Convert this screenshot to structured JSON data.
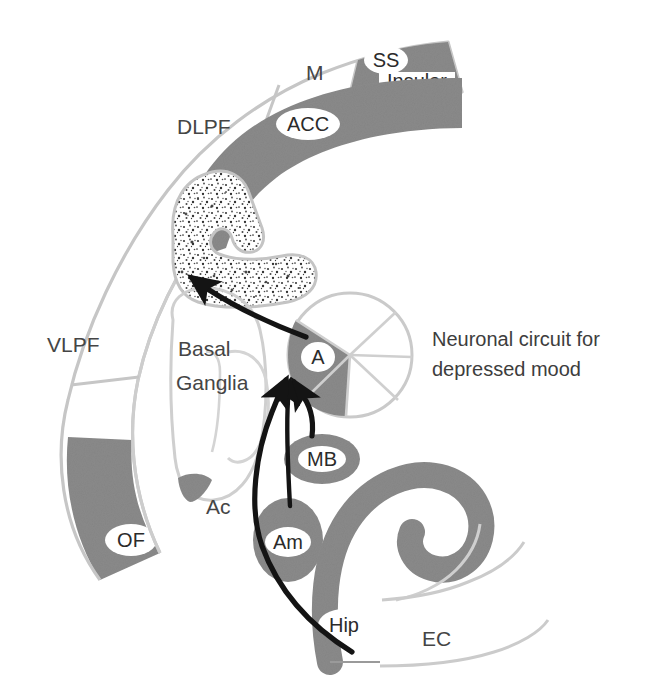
{
  "figure": {
    "title_caption": {
      "line1": "Neuronal circuit for",
      "line2": "depressed mood"
    },
    "colors": {
      "background": "#ffffff",
      "shaded_region": "#8a8a8a",
      "outline_light": "#c8c8c8",
      "outline_mid": "#b0b0b0",
      "arrow": "#141414",
      "text": "#3a3a3a",
      "badge_fill": "#ffffff",
      "stipple_dot": "#3c3c3c"
    },
    "cortical_arc": {
      "description": "outer cortical ribbon arc",
      "segments": [
        {
          "id": "vlpf",
          "label": "VLPF",
          "shaded": false
        },
        {
          "id": "dlpf",
          "label": "DLPF",
          "shaded": false
        },
        {
          "id": "m",
          "label": "M",
          "shaded": false
        },
        {
          "id": "ss",
          "label": "SS",
          "shaded": true,
          "badge": true
        },
        {
          "id": "insular",
          "label": "Insular",
          "shaded": true,
          "badge": true
        },
        {
          "id": "of",
          "label": "OF",
          "shaded": true,
          "badge": true
        }
      ]
    },
    "inner_structures": [
      {
        "id": "acc",
        "label": "ACC",
        "shaded": true,
        "badge": true
      },
      {
        "id": "cingulate-stipple",
        "label": "",
        "shaded": false,
        "badge": false
      },
      {
        "id": "basal-ganglia",
        "label_line1": "Basal",
        "label_line2": "Ganglia",
        "shaded": false,
        "badge": false
      },
      {
        "id": "accumbens",
        "label": "Ac",
        "shaded": true,
        "badge": false
      },
      {
        "id": "thalamus-a",
        "label": "A",
        "shaded": true,
        "badge": true
      },
      {
        "id": "mammillary-body",
        "label": "MB",
        "shaded": true,
        "badge": true
      },
      {
        "id": "amygdala",
        "label": "Am",
        "shaded": true,
        "badge": true
      },
      {
        "id": "hippocampus",
        "label": "Hip",
        "shaded": true,
        "badge": true
      },
      {
        "id": "entorhinal-cortex",
        "label": "EC",
        "shaded": false,
        "badge": false
      }
    ],
    "connections": [
      {
        "id": "thalamus-to-cingulate",
        "from": "thalamus-a",
        "to": "cingulate-stipple",
        "style": "arrow"
      },
      {
        "id": "mammillary-to-thalamus",
        "from": "mammillary-body",
        "to": "thalamus-a",
        "style": "arrow"
      },
      {
        "id": "amygdala-to-thalamus",
        "from": "amygdala",
        "to": "thalamus-a",
        "style": "arrow"
      },
      {
        "id": "hippocampus-to-thalamus",
        "from": "hippocampus",
        "to": "thalamus-a",
        "style": "arrow"
      }
    ],
    "labels": {
      "vlpf": "VLPF",
      "dlpf": "DLPF",
      "m": "M",
      "ss": "SS",
      "insular": "Insular",
      "of": "OF",
      "acc": "ACC",
      "basal": "Basal",
      "ganglia": "Ganglia",
      "ac": "Ac",
      "a": "A",
      "mb": "MB",
      "am": "Am",
      "hip": "Hip",
      "ec": "EC"
    }
  }
}
